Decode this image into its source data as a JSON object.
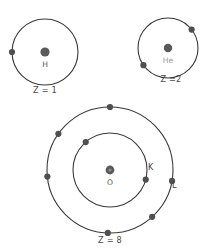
{
  "figure": {
    "background_color": "#ffffff",
    "shell_stroke_color": "#3a3a3a",
    "electron_color": "#4f4f4f",
    "nucleus_color": "#5a5a5a",
    "label_color": "#4a4a4a"
  },
  "atoms": [
    {
      "id": "hydrogen",
      "symbol": "H",
      "symbol_color": "#555555",
      "atomic_number_label": "Z = 1",
      "atomic_number": 1,
      "center": {
        "x": 45,
        "y": 52
      },
      "nucleus_radius": 4.6,
      "shells": [
        {
          "name": "",
          "radius": 33,
          "electron_count": 1,
          "electron_angles_deg": [
            180
          ]
        }
      ],
      "symbol_position": {
        "x": 45,
        "y": 65
      },
      "z_label_position": {
        "x": 45,
        "y": 90
      }
    },
    {
      "id": "helium",
      "symbol": "He",
      "symbol_color": "#9a9a9a",
      "atomic_number_label": "Z =2",
      "atomic_number": 2,
      "center": {
        "x": 168,
        "y": 48
      },
      "nucleus_radius": 4.2,
      "shells": [
        {
          "name": "",
          "radius": 30,
          "electron_count": 2,
          "electron_angles_deg": [
            38,
            215
          ]
        }
      ],
      "symbol_position": {
        "x": 168,
        "y": 61
      },
      "z_label_position": {
        "x": 171,
        "y": 79
      }
    },
    {
      "id": "oxygen",
      "symbol": "O",
      "symbol_color": "#555555",
      "atomic_number_label": "Z = 8",
      "atomic_number": 8,
      "center": {
        "x": 110,
        "y": 170
      },
      "nucleus_radius": 4.4,
      "shells": [
        {
          "name": "K",
          "radius": 37,
          "electron_count": 2,
          "electron_angles_deg": [
            131,
            345
          ],
          "label_position": {
            "x": 148,
            "y": 167
          }
        },
        {
          "name": "L",
          "radius": 63,
          "electron_count": 6,
          "electron_angles_deg": [
            90,
            145,
            186,
            350,
            312,
            268
          ],
          "label_position": {
            "x": 172,
            "y": 185
          }
        }
      ],
      "symbol_position": {
        "x": 110,
        "y": 183
      },
      "z_label_position": {
        "x": 110,
        "y": 240
      }
    }
  ]
}
